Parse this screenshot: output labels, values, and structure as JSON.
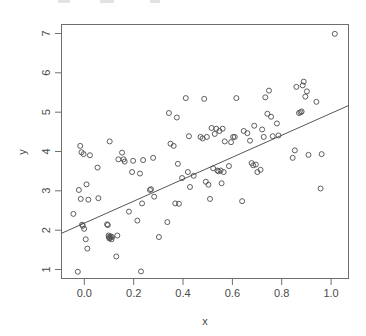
{
  "figure": {
    "kind": "scatter-plot-with-regression-line",
    "background_color": "#ffffff",
    "frame_color": "#6e6e6e",
    "point_color": "#4d4d4d",
    "line_color": "#55555c"
  },
  "chart_data": {
    "type": "scatter",
    "title": "",
    "xlabel": "x",
    "ylabel": "y",
    "xlim": [
      -0.04,
      1.05
    ],
    "ylim": [
      0.55,
      7.35
    ],
    "xticks": [
      0.0,
      0.2,
      0.4,
      0.6,
      0.8,
      1.0
    ],
    "xtick_labels": [
      "0.0",
      "0.2",
      "0.4",
      "0.6",
      "0.8",
      "1.0"
    ],
    "yticks": [
      1,
      2,
      3,
      4,
      5,
      6,
      7
    ],
    "ytick_labels": [
      "1",
      "2",
      "3",
      "4",
      "5",
      "6",
      "7"
    ],
    "grid": false,
    "legend": null,
    "marker": "open-circle",
    "marker_size": 5,
    "n_points": 110,
    "fit_line": {
      "type": "linear-regression",
      "intercept": 1.88,
      "slope": 3.14,
      "x_start": -0.04,
      "y_start": 1.76,
      "x_end": 1.05,
      "y_end": 5.18
    },
    "x": [
      0.005,
      0.022,
      0.026,
      0.031,
      0.033,
      0.036,
      0.038,
      0.041,
      0.044,
      0.046,
      0.052,
      0.055,
      0.058,
      0.062,
      0.068,
      0.097,
      0.1,
      0.133,
      0.136,
      0.139,
      0.14,
      0.142,
      0.143,
      0.145,
      0.147,
      0.15,
      0.152,
      0.168,
      0.172,
      0.176,
      0.19,
      0.196,
      0.2,
      0.216,
      0.228,
      0.232,
      0.248,
      0.258,
      0.262,
      0.266,
      0.27,
      0.296,
      0.3,
      0.308,
      0.312,
      0.33,
      0.362,
      0.368,
      0.374,
      0.386,
      0.392,
      0.398,
      0.402,
      0.406,
      0.418,
      0.432,
      0.44,
      0.444,
      0.448,
      0.462,
      0.488,
      0.496,
      0.502,
      0.508,
      0.512,
      0.518,
      0.524,
      0.53,
      0.536,
      0.542,
      0.548,
      0.552,
      0.556,
      0.56,
      0.564,
      0.568,
      0.572,
      0.576,
      0.58,
      0.596,
      0.604,
      0.612,
      0.618,
      0.624,
      0.646,
      0.652,
      0.666,
      0.676,
      0.682,
      0.688,
      0.692,
      0.698,
      0.704,
      0.716,
      0.722,
      0.728,
      0.734,
      0.742,
      0.748,
      0.756,
      0.762,
      0.778,
      0.784,
      0.838,
      0.846,
      0.852,
      0.862,
      0.868,
      0.872,
      0.876,
      0.88,
      0.886,
      0.892,
      0.898,
      0.928,
      0.944,
      0.948,
      0.998
    ],
    "y": [
      2.28,
      0.73,
      2.92,
      4.1,
      2.68,
      3.93,
      1.99,
      1.96,
      3.88,
      1.88,
      1.6,
      3.07,
      1.35,
      2.66,
      3.85,
      3.52,
      2.7,
      2.0,
      1.98,
      1.7,
      1.66,
      1.62,
      4.22,
      1.64,
      1.68,
      1.6,
      1.66,
      1.14,
      1.7,
      3.74,
      3.92,
      3.74,
      3.68,
      2.34,
      3.4,
      3.7,
      2.1,
      3.36,
      0.74,
      2.56,
      3.72,
      2.92,
      2.94,
      3.78,
      2.74,
      1.66,
      2.06,
      4.98,
      4.16,
      4.1,
      2.56,
      4.86,
      3.62,
      2.55,
      3.24,
      5.38,
      3.4,
      4.36,
      3.0,
      3.3,
      4.34,
      4.3,
      5.36,
      3.14,
      4.34,
      3.06,
      2.68,
      4.58,
      3.5,
      4.42,
      4.56,
      3.44,
      3.42,
      4.5,
      3.44,
      3.1,
      4.56,
      3.4,
      4.22,
      3.56,
      4.2,
      4.34,
      4.34,
      5.38,
      2.62,
      4.5,
      4.44,
      4.24,
      3.64,
      3.58,
      4.64,
      3.6,
      3.4,
      3.46,
      4.54,
      4.34,
      5.4,
      4.96,
      5.58,
      4.88,
      4.36,
      4.7,
      4.38,
      3.78,
      3.98,
      5.68,
      4.98,
      5.0,
      5.02,
      5.72,
      5.82,
      5.42,
      5.56,
      3.86,
      5.28,
      2.96,
      3.88,
      7.1,
      6.26,
      5.22
    ]
  }
}
